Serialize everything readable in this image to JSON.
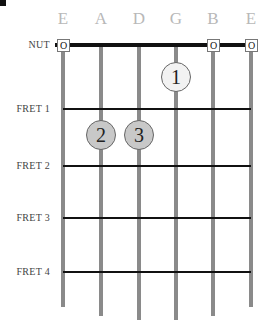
{
  "chord_diagram": {
    "strings": [
      {
        "name": "E",
        "x": 63,
        "end_y": 307,
        "open": true
      },
      {
        "name": "A",
        "x": 101,
        "end_y": 316,
        "open": false
      },
      {
        "name": "D",
        "x": 139,
        "end_y": 320,
        "open": false
      },
      {
        "name": "G",
        "x": 176,
        "end_y": 320,
        "open": false
      },
      {
        "name": "B",
        "x": 213,
        "end_y": 316,
        "open": true
      },
      {
        "name": "E",
        "x": 251,
        "end_y": 307,
        "open": true
      }
    ],
    "nut_label": "NUT",
    "open_marker": "O",
    "frets": [
      {
        "label": "FRET 1",
        "y": 109
      },
      {
        "label": "FRET 2",
        "y": 166
      },
      {
        "label": "FRET 3",
        "y": 218
      },
      {
        "label": "FRET 4",
        "y": 272
      }
    ],
    "fingers": [
      {
        "number": "1",
        "string": "G",
        "fret_space": 1,
        "x": 176,
        "y": 77,
        "fill": "#f2f2f2"
      },
      {
        "number": "2",
        "string": "A",
        "fret_space": 2,
        "x": 101,
        "y": 135,
        "fill": "#c8c8c8"
      },
      {
        "number": "3",
        "string": "D",
        "fret_space": 2,
        "x": 139,
        "y": 135,
        "fill": "#c8c8c8"
      }
    ],
    "colors": {
      "string": "#8a8a8a",
      "fret": "#111111",
      "string_label": "#b8b8b8"
    }
  }
}
